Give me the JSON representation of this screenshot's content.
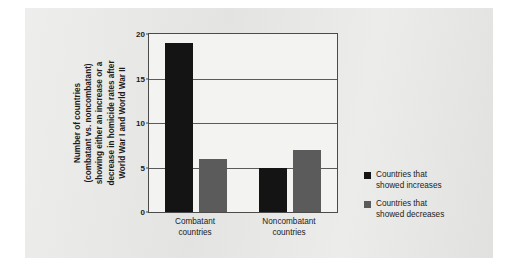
{
  "chart_data": {
    "type": "bar",
    "title": "",
    "xlabel": "",
    "ylabel_lines": [
      "Number of countries",
      "(combatant vs. noncombatant)",
      "showing either an increase or a",
      "decrease in homicide rates after",
      "World War I and World War II"
    ],
    "categories": [
      "Combatant countries",
      "Noncombatant countries"
    ],
    "category_lines": [
      [
        "Combatant",
        "countries"
      ],
      [
        "Noncombatant",
        "countries"
      ]
    ],
    "series": [
      {
        "name": "Countries that showed increases",
        "color": "#141414",
        "values": [
          19,
          5
        ]
      },
      {
        "name": "Countries that showed decreases",
        "color": "#5b5b5b",
        "values": [
          6,
          7
        ]
      }
    ],
    "ylim": [
      0,
      20
    ],
    "yticks": [
      0,
      5,
      10,
      15,
      20
    ],
    "ytick_labels": [
      "0",
      "5",
      "10",
      "15",
      "20"
    ],
    "grid": true,
    "legend_position": "right"
  },
  "legend": {
    "entries": [
      {
        "line1": "Countries that",
        "line2": "showed increases",
        "swatch": "dark"
      },
      {
        "line1": "Countries that",
        "line2": "showed decreases",
        "swatch": "gray"
      }
    ]
  },
  "colors": {
    "increases": "#141414",
    "decreases": "#5b5b5b",
    "page_background": "#e8e8e6",
    "plot_background": "#f3f3f1",
    "axis": "#4b4b4b"
  }
}
